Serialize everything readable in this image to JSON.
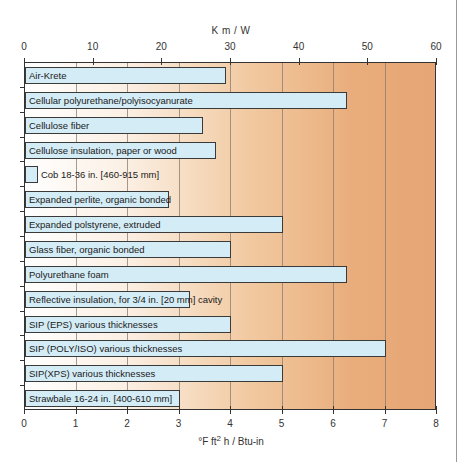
{
  "chart_data": {
    "type": "bar",
    "orientation": "horizontal",
    "title": "",
    "categories": [
      "Air-Krete",
      "Cellular polyurethane/polyisocyanurate",
      "Cellulose fiber",
      "Cellulose insulation, paper or wood",
      "Cob 18-36 in. [460-915 mm]",
      "Expanded perlite, organic bonded",
      "Expanded polstyrene, extruded",
      "Glass fiber, organic bonded",
      "Polyurethane foam",
      "Reflective insulation, for 3/4 in. [20 mm] cavity",
      "SIP (EPS) various thicknesses",
      "SIP (POLY/ISO) various thicknesses",
      "SIP(XPS) various thicknesses",
      "Strawbale 16-24 in. [400-610 mm]"
    ],
    "values": [
      3.9,
      6.25,
      3.45,
      3.7,
      0.25,
      2.8,
      5.0,
      4.0,
      6.25,
      3.2,
      4.0,
      7.0,
      5.0,
      3.0
    ],
    "xlabel": "°F ft² h / Btu-in",
    "xlabel_top": "K m / W",
    "ylabel": "",
    "xlim": [
      0,
      8
    ],
    "xlim_top": [
      0,
      60
    ],
    "x_ticks": [
      "0",
      "1",
      "2",
      "3",
      "4",
      "5",
      "6",
      "7",
      "8"
    ],
    "x_ticks_top": [
      "0",
      "10",
      "20",
      "30",
      "40",
      "50",
      "60"
    ],
    "grid": true,
    "legend": null,
    "colors": {
      "bar_fill": "#d4ecf5",
      "bar_border": "#3a3a3a",
      "background_start": "#ffffff",
      "background_end": "#e6a574"
    }
  },
  "axes": {
    "top_title": "K m / W",
    "bottom_title_prefix": "°F ft",
    "bottom_title_sup": "2",
    "bottom_title_suffix": " h / Btu-in"
  }
}
